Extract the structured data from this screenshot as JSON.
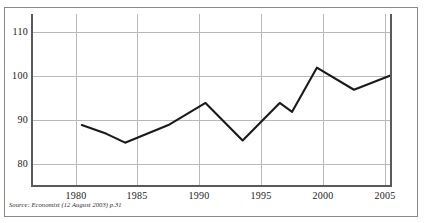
{
  "source_note": {
    "prefix": "Source:",
    "publication": "Economist",
    "detail": "(12 August 2003) p.31",
    "full": "Source: Economist (12 August 2003) p.31"
  },
  "chart_data": {
    "type": "line",
    "title": "",
    "subtitle": "",
    "xlabel": "",
    "ylabel": "",
    "xlim": [
      1976.4,
      2005.5
    ],
    "ylim": [
      75,
      114
    ],
    "grid": true,
    "legend": "none",
    "xticks": [
      1980,
      1985,
      1990,
      1995,
      2000,
      2005
    ],
    "xtick_labels": [
      "1980",
      "1985",
      "1990",
      "1995",
      "2000",
      "2005"
    ],
    "yticks": [
      80,
      90,
      100,
      110
    ],
    "ytick_labels": [
      "80",
      "90",
      "100",
      "110"
    ],
    "series": [
      {
        "name": "index",
        "color": "#1a1a1a",
        "x": [
          1978.0,
          1980.0,
          1981.5,
          1985.0,
          1988.0,
          1991.0,
          1994.0,
          1995.0,
          1997.0,
          2000.0,
          2003.0
        ],
        "values": [
          92.0,
          90.0,
          88.0,
          92.0,
          97.0,
          88.5,
          97.0,
          95.0,
          105.0,
          100.0,
          103.3
        ]
      }
    ]
  }
}
